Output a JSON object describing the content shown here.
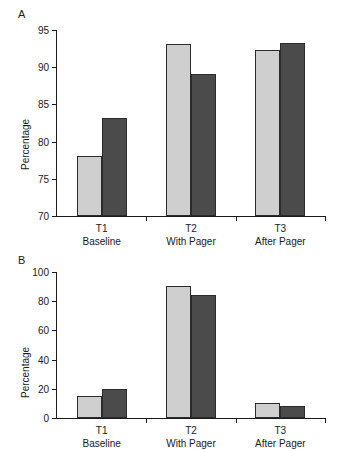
{
  "figure": {
    "panels": [
      {
        "label": "A",
        "ylabel": "Percentage",
        "ylim": [
          70,
          95
        ],
        "yticks": [
          70,
          75,
          80,
          85,
          90,
          95
        ],
        "ytick_labels": [
          "70",
          "75",
          "80",
          "85",
          "90",
          "95"
        ],
        "categories": [
          "T1",
          "T2",
          "T3"
        ],
        "category_sublabels": [
          "Baseline",
          "With Pager",
          "After Pager"
        ],
        "series": [
          {
            "name": "light",
            "color": "#cfcfcf",
            "values": [
              78.0,
              93.1,
              92.3
            ]
          },
          {
            "name": "dark",
            "color": "#4b4b4b",
            "values": [
              83.2,
              89.1,
              93.3
            ]
          }
        ]
      },
      {
        "label": "B",
        "ylabel": "Percentage",
        "ylim": [
          0,
          100
        ],
        "yticks": [
          0,
          20,
          40,
          60,
          80,
          100
        ],
        "ytick_labels": [
          "0",
          "20",
          "40",
          "60",
          "80",
          "100"
        ],
        "categories": [
          "T1",
          "T2",
          "T3"
        ],
        "category_sublabels": [
          "Baseline",
          "With Pager",
          "After Pager"
        ],
        "series": [
          {
            "name": "light",
            "color": "#cfcfcf",
            "values": [
              15.0,
              90.5,
              10.0
            ]
          },
          {
            "name": "dark",
            "color": "#4b4b4b",
            "values": [
              19.7,
              84.0,
              8.5
            ]
          }
        ]
      }
    ]
  },
  "chart_data": [
    {
      "type": "bar",
      "title": "A",
      "xlabel": "",
      "ylabel": "Percentage",
      "ylim": [
        70,
        95
      ],
      "yticks": [
        70,
        75,
        80,
        85,
        90,
        95
      ],
      "grid": false,
      "legend": "none",
      "categories": [
        "T1",
        "T2",
        "T3"
      ],
      "category_sublabels": [
        "Baseline",
        "With Pager",
        "After Pager"
      ],
      "series": [
        {
          "name": "light gray bar",
          "values": [
            78.0,
            93.1,
            92.3
          ]
        },
        {
          "name": "dark gray bar",
          "values": [
            83.2,
            89.1,
            93.3
          ]
        }
      ]
    },
    {
      "type": "bar",
      "title": "B",
      "xlabel": "",
      "ylabel": "Percentage",
      "ylim": [
        0,
        100
      ],
      "yticks": [
        0,
        20,
        40,
        60,
        80,
        100
      ],
      "grid": false,
      "legend": "none",
      "categories": [
        "T1",
        "T2",
        "T3"
      ],
      "category_sublabels": [
        "Baseline",
        "With Pager",
        "After Pager"
      ],
      "series": [
        {
          "name": "light gray bar",
          "values": [
            15.0,
            90.5,
            10.0
          ]
        },
        {
          "name": "dark gray bar",
          "values": [
            19.7,
            84.0,
            8.5
          ]
        }
      ]
    }
  ]
}
